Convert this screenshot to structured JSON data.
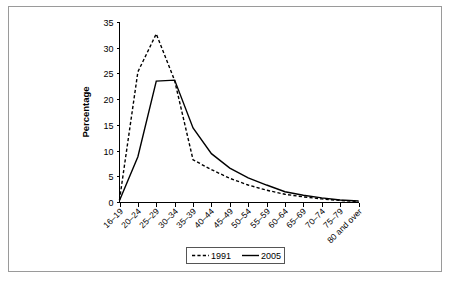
{
  "chart_data": {
    "type": "line",
    "title": "",
    "xlabel": "",
    "ylabel": "Percentage",
    "ylim": [
      0,
      35
    ],
    "yticks": [
      0,
      5,
      10,
      15,
      20,
      25,
      30,
      35
    ],
    "grid": false,
    "legend_position": "bottom-center",
    "categories": [
      "16–19",
      "20–24",
      "25–29",
      "30–34",
      "35–39",
      "40–44",
      "45–49",
      "50–54",
      "55–59",
      "60–64",
      "65–69",
      "70–74",
      "75–79",
      "80 and over"
    ],
    "series": [
      {
        "name": "1991",
        "style": "dashed",
        "color": "#000000",
        "values": [
          0.4,
          25.3,
          32.7,
          23.6,
          8.2,
          6.3,
          4.6,
          3.3,
          2.3,
          1.5,
          1.0,
          0.6,
          0.3,
          0.1
        ]
      },
      {
        "name": "2005",
        "style": "solid",
        "color": "#000000",
        "values": [
          0.3,
          8.8,
          23.5,
          23.7,
          14.4,
          9.4,
          6.6,
          4.7,
          3.3,
          2.0,
          1.3,
          0.8,
          0.4,
          0.2
        ]
      }
    ]
  },
  "legend": {
    "items": [
      {
        "label": "1991",
        "style": "dashed"
      },
      {
        "label": "2005",
        "style": "solid"
      }
    ]
  },
  "axes": {
    "y_title": "Percentage"
  }
}
